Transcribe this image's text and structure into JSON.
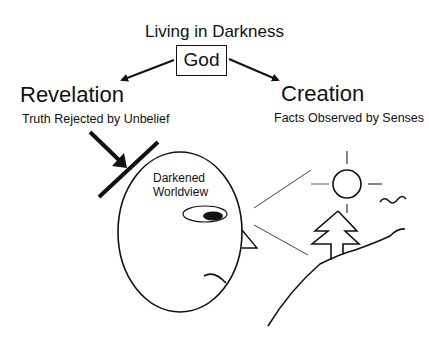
{
  "diagram": {
    "title": "Living in Darkness",
    "center_node": "God",
    "left_branch": {
      "label": "Revelation",
      "sublabel": "Truth Rejected by Unbelief"
    },
    "right_branch": {
      "label": "Creation",
      "sublabel": "Facts Observed by Senses"
    },
    "head_label": "Darkened Worldview",
    "head_label_lines": [
      "Darkened",
      "Worldview"
    ],
    "icons": [
      "arrow-icon",
      "barrier-icon",
      "head-icon",
      "eye-icon",
      "sun-icon",
      "tree-icon",
      "bird-icon",
      "hill-icon"
    ],
    "colors": {
      "stroke": "#111111",
      "background": "#ffffff",
      "sight_lines": "#444444"
    }
  }
}
